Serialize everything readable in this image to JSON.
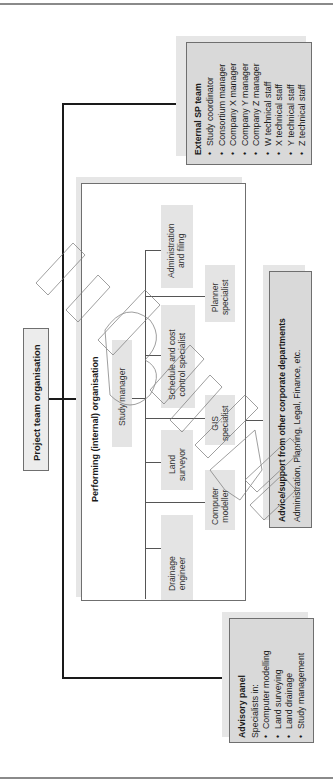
{
  "title": "Project team organisation",
  "external_sp_team": {
    "heading": "External SP team",
    "items": [
      "Study coordinator",
      "Consortium manager",
      "Company X manager",
      "Company Y manager",
      "Company Z manager",
      "W technical staff",
      "X technical staff",
      "Y technical staff",
      "Z technical staff"
    ]
  },
  "performing_org": {
    "heading": "Performing (internal) organisation",
    "study_manager": "Study manager",
    "roles": {
      "admin": [
        "Administration",
        "and filing"
      ],
      "schedule": [
        "Schedule and cost",
        "control specialist"
      ],
      "land": [
        "Land",
        "surveyor"
      ],
      "drainage": [
        "Drainage",
        "engineer"
      ],
      "planner": [
        "Planner",
        "specialist"
      ],
      "gis": [
        "GIS",
        "specialist"
      ],
      "computer": [
        "Computer",
        "modeller"
      ]
    }
  },
  "advice": {
    "heading": "Advice/support from other corporate departments",
    "text": "Administration, Planning, Legal, Finance, etc."
  },
  "advisory_panel": {
    "heading": "Advisory panel",
    "intro": "Specialists in:",
    "items": [
      "Computer modelling",
      "Land surveying",
      "Land drainage",
      "Study management"
    ]
  },
  "colors": {
    "box_fill": "#d9d9d9",
    "node_fill": "#e4e4e4",
    "line": "#1a1a1a"
  }
}
